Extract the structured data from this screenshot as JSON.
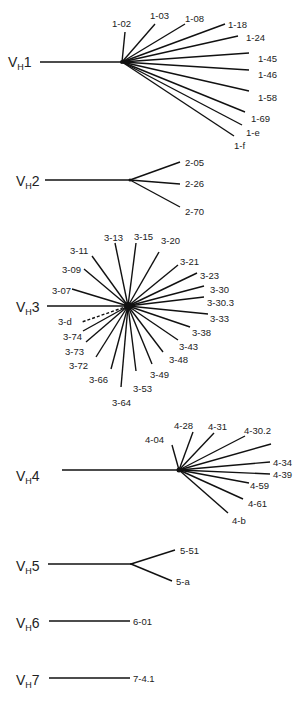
{
  "colors": {
    "line": "#111111",
    "text": "#222222",
    "background": "#ffffff"
  },
  "families": [
    {
      "id": "vh1",
      "label_main": "V",
      "label_sub": "H",
      "label_num": "1",
      "label_pos": [
        8,
        67
      ],
      "stem": [
        40,
        62,
        122,
        62
      ],
      "hub_r": 2,
      "branches": [
        {
          "gene": "1-02",
          "end": [
            125,
            32
          ],
          "label": [
            112,
            27
          ]
        },
        {
          "gene": "1-03",
          "end": [
            155,
            24
          ],
          "label": [
            150,
            19
          ]
        },
        {
          "gene": "1-08",
          "end": [
            185,
            24
          ],
          "label": [
            185,
            22
          ]
        },
        {
          "gene": "1-18",
          "end": [
            225,
            24
          ],
          "label": [
            228,
            28
          ]
        },
        {
          "gene": "1-24",
          "end": [
            238,
            36
          ],
          "label": [
            246,
            41
          ]
        },
        {
          "gene": "1-45",
          "end": [
            249,
            53
          ],
          "label": [
            258,
            62
          ]
        },
        {
          "gene": "1-46",
          "end": [
            249,
            70
          ],
          "label": [
            258,
            78
          ]
        },
        {
          "gene": "1-58",
          "end": [
            249,
            91
          ],
          "label": [
            258,
            101
          ]
        },
        {
          "gene": "1-69",
          "end": [
            245,
            112
          ],
          "label": [
            251,
            122
          ]
        },
        {
          "gene": "1-e",
          "end": [
            242,
            125
          ],
          "label": [
            246,
            136
          ]
        },
        {
          "gene": "1-f",
          "end": [
            234,
            136
          ],
          "label": [
            234,
            149
          ]
        }
      ]
    },
    {
      "id": "vh2",
      "label_main": "V",
      "label_sub": "H",
      "label_num": "2",
      "label_pos": [
        16,
        186
      ],
      "stem": [
        45,
        180,
        130,
        180
      ],
      "hub_r": 1.5,
      "branches": [
        {
          "gene": "2-05",
          "end": [
            180,
            162
          ],
          "label": [
            185,
            166
          ]
        },
        {
          "gene": "2-26",
          "end": [
            180,
            184
          ],
          "label": [
            185,
            187
          ]
        },
        {
          "gene": "2-70",
          "end": [
            180,
            207
          ],
          "label": [
            185,
            215
          ]
        }
      ]
    },
    {
      "id": "vh3",
      "label_main": "V",
      "label_sub": "H",
      "label_num": "3",
      "label_pos": [
        16,
        312
      ],
      "stem": [
        47,
        306,
        128,
        306
      ],
      "hub_r": 4,
      "branches": [
        {
          "gene": "3-13",
          "end": [
            115,
            243
          ],
          "label": [
            104,
            241
          ]
        },
        {
          "gene": "3-15",
          "end": [
            136,
            243
          ],
          "label": [
            134,
            240
          ]
        },
        {
          "gene": "3-20",
          "end": [
            159,
            252
          ],
          "label": [
            161,
            244
          ]
        },
        {
          "gene": "3-11",
          "end": [
            92,
            256
          ],
          "label": [
            70,
            254
          ]
        },
        {
          "gene": "3-21",
          "end": [
            178,
            265
          ],
          "label": [
            180,
            265
          ]
        },
        {
          "gene": "3-09",
          "end": [
            84,
            269
          ],
          "label": [
            62,
            273
          ]
        },
        {
          "gene": "3-23",
          "end": [
            197,
            273
          ],
          "label": [
            200,
            279
          ]
        },
        {
          "gene": "3-07",
          "end": [
            72,
            289
          ],
          "label": [
            52,
            294
          ]
        },
        {
          "gene": "3-30",
          "end": [
            204,
            286
          ],
          "label": [
            210,
            293
          ]
        },
        {
          "gene": "3-30.3",
          "end": [
            204,
            297
          ],
          "label": [
            207,
            306
          ]
        },
        {
          "gene": "3-33",
          "end": [
            208,
            314
          ],
          "label": [
            210,
            322
          ]
        },
        {
          "gene": "3-38",
          "end": [
            190,
            327
          ],
          "label": [
            192,
            336
          ]
        },
        {
          "gene": "3-43",
          "end": [
            178,
            340
          ],
          "label": [
            179,
            350
          ]
        },
        {
          "gene": "3-48",
          "end": [
            163,
            352
          ],
          "label": [
            169,
            363
          ]
        },
        {
          "gene": "3-49",
          "end": [
            152,
            364
          ],
          "label": [
            150,
            378
          ]
        },
        {
          "gene": "3-53",
          "end": [
            136,
            371
          ],
          "label": [
            133,
            392
          ]
        },
        {
          "gene": "3-64",
          "end": [
            121,
            387
          ],
          "label": [
            112,
            406
          ]
        },
        {
          "gene": "3-66",
          "end": [
            111,
            369
          ],
          "label": [
            89,
            383
          ]
        },
        {
          "gene": "3-72",
          "end": [
            96,
            357
          ],
          "label": [
            69,
            369
          ]
        },
        {
          "gene": "3-73",
          "end": [
            86,
            342
          ],
          "label": [
            65,
            355
          ]
        },
        {
          "gene": "3-74",
          "end": [
            83,
            331
          ],
          "label": [
            63,
            340
          ]
        },
        {
          "gene": "3-d",
          "end": [
            82,
            322
          ],
          "label": [
            58,
            325
          ],
          "dashed": true
        }
      ]
    },
    {
      "id": "vh4",
      "label_main": "V",
      "label_sub": "H",
      "label_num": "4",
      "label_pos": [
        16,
        481
      ],
      "stem": [
        62,
        470,
        179,
        470
      ],
      "hub_r": 2.5,
      "branches": [
        {
          "gene": "4-04",
          "end": [
            172,
            445
          ],
          "label": [
            145,
            443
          ]
        },
        {
          "gene": "4-28",
          "end": [
            193,
            432
          ],
          "label": [
            174,
            429
          ]
        },
        {
          "gene": "4-31",
          "end": [
            214,
            433
          ],
          "label": [
            208,
            430
          ]
        },
        {
          "gene": "4-30.2",
          "end": [
            245,
            436
          ],
          "label": [
            244,
            434
          ]
        },
        {
          "gene": "",
          "end": [
            271,
            444
          ],
          "label": [
            271,
            444
          ]
        },
        {
          "gene": "4-34",
          "end": [
            270,
            462
          ],
          "label": [
            273,
            466
          ]
        },
        {
          "gene": "4-39",
          "end": [
            270,
            474
          ],
          "label": [
            273,
            478
          ]
        },
        {
          "gene": "4-59",
          "end": [
            249,
            483
          ],
          "label": [
            250,
            489
          ]
        },
        {
          "gene": "4-61",
          "end": [
            243,
            499
          ],
          "label": [
            248,
            507
          ]
        },
        {
          "gene": "4-b",
          "end": [
            228,
            513
          ],
          "label": [
            232,
            524
          ]
        }
      ]
    },
    {
      "id": "vh5",
      "label_main": "V",
      "label_sub": "H",
      "label_num": "5",
      "label_pos": [
        16,
        571
      ],
      "stem": [
        48,
        564,
        131,
        564
      ],
      "hub_r": 1,
      "branches": [
        {
          "gene": "5-51",
          "end": [
            175,
            550
          ],
          "label": [
            180,
            554
          ]
        },
        {
          "gene": "5-a",
          "end": [
            172,
            581
          ],
          "label": [
            176,
            585
          ]
        }
      ]
    },
    {
      "id": "vh6",
      "label_main": "V",
      "label_sub": "H",
      "label_num": "6",
      "label_pos": [
        16,
        628
      ],
      "stem": [
        49,
        621,
        130,
        621
      ],
      "hub_r": 0,
      "branches": [
        {
          "gene": "6-01",
          "end": [
            130,
            621
          ],
          "label": [
            133,
            625
          ]
        }
      ]
    },
    {
      "id": "vh7",
      "label_main": "V",
      "label_sub": "H",
      "label_num": "7",
      "label_pos": [
        16,
        685
      ],
      "stem": [
        49,
        678,
        130,
        678
      ],
      "hub_r": 0,
      "branches": [
        {
          "gene": "7-4.1",
          "end": [
            130,
            678
          ],
          "label": [
            133,
            682
          ]
        }
      ]
    }
  ]
}
